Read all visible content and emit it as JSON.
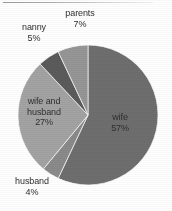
{
  "chart_data": {
    "type": "pie",
    "title": "",
    "subtitle": "",
    "xlabel": "",
    "ylabel": "",
    "legend_position": "none",
    "grid": false,
    "labels_format": "name + percent",
    "categories": [
      "wife",
      "husband",
      "wife and husband",
      "nanny",
      "parents"
    ],
    "values": [
      57,
      4,
      27,
      5,
      7
    ],
    "units": "percent",
    "start_angle_deg": 0,
    "direction": "clockwise",
    "slices": [
      {
        "name": "wife",
        "label": "wife",
        "percent_text": "57%",
        "value": 57,
        "color": "#6e6e6e",
        "label_placement": "inside"
      },
      {
        "name": "husband",
        "label": "husband",
        "percent_text": "4%",
        "value": 4,
        "color": "#8a8a8a",
        "label_placement": "outside-bottom-left"
      },
      {
        "name": "wife and husband",
        "label": "wife and\nhusband",
        "label_line1": "wife and",
        "label_line2": "husband",
        "percent_text": "27%",
        "value": 27,
        "color": "#a3a3a3",
        "label_placement": "inside"
      },
      {
        "name": "nanny",
        "label": "nanny",
        "percent_text": "5%",
        "value": 5,
        "color": "#5b5b5b",
        "label_placement": "outside-top-left"
      },
      {
        "name": "parents",
        "label": "parents",
        "percent_text": "7%",
        "value": 7,
        "color": "#969696",
        "label_placement": "outside-top"
      }
    ]
  },
  "colors": {
    "background": "#ffffff",
    "text": "#2f2f2f",
    "slice_border": "#ffffff",
    "top_rule": "#a8a8a8"
  }
}
